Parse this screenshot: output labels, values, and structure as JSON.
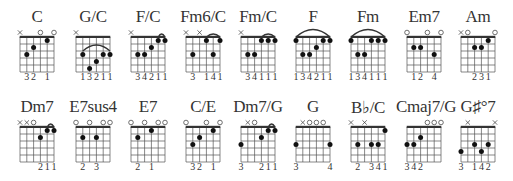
{
  "layout": {
    "columns_x": [
      37,
      93,
      148,
      203,
      258,
      313,
      368,
      424,
      478
    ],
    "rows_y": [
      0,
      90
    ]
  },
  "colors": {
    "ink": "#333333",
    "grid": "#555555"
  },
  "chords": [
    {
      "name": "C",
      "row": 0,
      "col": 0,
      "markers": [
        "x",
        "",
        "",
        "o",
        "",
        "o"
      ],
      "dots": [
        [
          1,
          3
        ],
        [
          2,
          2
        ],
        [
          4,
          1
        ]
      ],
      "barre": null,
      "arc": null,
      "fingering": [
        "",
        "3",
        "2",
        "",
        "1",
        ""
      ]
    },
    {
      "name": "G/C",
      "row": 0,
      "col": 1,
      "markers": [
        "x",
        "",
        "",
        "",
        "",
        ""
      ],
      "dots": [
        [
          1,
          3
        ],
        [
          2,
          5
        ],
        [
          3,
          4
        ],
        [
          4,
          3
        ],
        [
          5,
          3
        ]
      ],
      "barre": null,
      "arc": [
        1,
        5,
        3
      ],
      "fingering": [
        "",
        "1",
        "3",
        "2",
        "1",
        "1"
      ]
    },
    {
      "name": "F/C",
      "row": 0,
      "col": 2,
      "markers": [
        "x",
        "",
        "",
        "",
        "",
        ""
      ],
      "dots": [
        [
          1,
          3
        ],
        [
          2,
          3
        ],
        [
          3,
          2
        ],
        [
          4,
          1
        ],
        [
          5,
          1
        ]
      ],
      "barre": null,
      "arc": [
        4,
        5,
        1
      ],
      "fingering": [
        "",
        "3",
        "4",
        "2",
        "1",
        "1"
      ]
    },
    {
      "name": "Fm6/C",
      "row": 0,
      "col": 3,
      "markers": [
        "x",
        "",
        "x",
        "",
        "",
        ""
      ],
      "dots": [
        [
          1,
          3
        ],
        [
          3,
          1
        ],
        [
          4,
          3
        ],
        [
          5,
          1
        ]
      ],
      "barre": null,
      "arc": [
        3,
        5,
        1
      ],
      "fingering": [
        "",
        "3",
        "",
        "1",
        "4",
        "1"
      ]
    },
    {
      "name": "Fm/C",
      "row": 0,
      "col": 4,
      "markers": [
        "x",
        "",
        "",
        "",
        "",
        ""
      ],
      "dots": [
        [
          1,
          3
        ],
        [
          2,
          3
        ],
        [
          3,
          1
        ],
        [
          4,
          1
        ],
        [
          5,
          1
        ]
      ],
      "barre": null,
      "arc": [
        3,
        5,
        1
      ],
      "fingering": [
        "",
        "3",
        "4",
        "1",
        "1",
        "1"
      ]
    },
    {
      "name": "F",
      "row": 0,
      "col": 5,
      "markers": [
        "",
        "",
        "",
        "",
        "",
        ""
      ],
      "dots": [
        [
          0,
          1
        ],
        [
          1,
          3
        ],
        [
          2,
          3
        ],
        [
          3,
          2
        ],
        [
          4,
          1
        ],
        [
          5,
          1
        ]
      ],
      "barre": null,
      "arc": [
        0,
        5,
        1
      ],
      "fingering": [
        "1",
        "3",
        "4",
        "2",
        "1",
        "1"
      ]
    },
    {
      "name": "Fm",
      "row": 0,
      "col": 6,
      "markers": [
        "",
        "",
        "",
        "",
        "",
        ""
      ],
      "dots": [
        [
          0,
          1
        ],
        [
          1,
          3
        ],
        [
          2,
          3
        ],
        [
          3,
          1
        ],
        [
          4,
          1
        ],
        [
          5,
          1
        ]
      ],
      "barre": null,
      "arc": [
        0,
        5,
        1
      ],
      "fingering": [
        "1",
        "3",
        "4",
        "1",
        "1",
        "1"
      ]
    },
    {
      "name": "Em7",
      "row": 0,
      "col": 7,
      "markers": [
        "o",
        "",
        "",
        "o",
        "",
        "o"
      ],
      "dots": [
        [
          1,
          2
        ],
        [
          2,
          2
        ],
        [
          4,
          3
        ]
      ],
      "barre": null,
      "arc": null,
      "fingering": [
        "",
        "1",
        "2",
        "",
        "4",
        ""
      ]
    },
    {
      "name": "Am",
      "row": 0,
      "col": 8,
      "markers": [
        "x",
        "o",
        "",
        "",
        "",
        "o"
      ],
      "dots": [
        [
          2,
          2
        ],
        [
          3,
          2
        ],
        [
          4,
          1
        ]
      ],
      "barre": null,
      "arc": null,
      "fingering": [
        "",
        "",
        "2",
        "3",
        "1",
        ""
      ]
    },
    {
      "name": "Dm7",
      "row": 1,
      "col": 0,
      "markers": [
        "x",
        "x",
        "o",
        "",
        "",
        ""
      ],
      "dots": [
        [
          3,
          2
        ],
        [
          4,
          1
        ],
        [
          5,
          1
        ]
      ],
      "barre": null,
      "arc": [
        4,
        5,
        1
      ],
      "fingering": [
        "",
        "",
        "",
        "2",
        "1",
        "1"
      ]
    },
    {
      "name": "E7sus4",
      "row": 1,
      "col": 1,
      "markers": [
        "o",
        "",
        "o",
        "",
        "o",
        "o"
      ],
      "dots": [
        [
          1,
          2
        ],
        [
          3,
          2
        ]
      ],
      "barre": null,
      "arc": null,
      "fingering": [
        "",
        "2",
        "",
        "3",
        "",
        ""
      ]
    },
    {
      "name": "E7",
      "row": 1,
      "col": 2,
      "markers": [
        "o",
        "",
        "o",
        "",
        "o",
        "o"
      ],
      "dots": [
        [
          1,
          2
        ],
        [
          3,
          1
        ]
      ],
      "barre": null,
      "arc": null,
      "fingering": [
        "",
        "2",
        "",
        "1",
        "",
        ""
      ]
    },
    {
      "name": "C/E",
      "row": 1,
      "col": 3,
      "markers": [
        "o",
        "",
        "",
        "o",
        "",
        "o"
      ],
      "dots": [
        [
          1,
          3
        ],
        [
          2,
          2
        ],
        [
          4,
          1
        ]
      ],
      "barre": null,
      "arc": null,
      "fingering": [
        "",
        "3",
        "2",
        "",
        "1",
        ""
      ]
    },
    {
      "name": "Dm7/G",
      "row": 1,
      "col": 4,
      "markers": [
        "",
        "x",
        "o",
        "",
        "",
        ""
      ],
      "dots": [
        [
          0,
          3
        ],
        [
          3,
          2
        ],
        [
          4,
          1
        ],
        [
          5,
          1
        ]
      ],
      "barre": null,
      "arc": [
        4,
        5,
        1
      ],
      "fingering": [
        "3",
        "",
        "",
        "2",
        "1",
        "1"
      ]
    },
    {
      "name": "G",
      "row": 1,
      "col": 5,
      "markers": [
        "",
        "x",
        "o",
        "o",
        "o",
        ""
      ],
      "dots": [
        [
          0,
          3
        ],
        [
          5,
          3
        ]
      ],
      "barre": null,
      "arc": null,
      "fingering": [
        "3",
        "",
        "",
        "",
        "",
        "4"
      ]
    },
    {
      "name": "B♭/C",
      "row": 1,
      "col": 6,
      "markers": [
        "x",
        "",
        "x",
        "",
        "",
        ""
      ],
      "dots": [
        [
          1,
          3
        ],
        [
          3,
          3
        ],
        [
          4,
          3
        ],
        [
          5,
          1
        ]
      ],
      "barre": null,
      "arc": null,
      "fingering": [
        "",
        "2",
        "",
        "3",
        "4",
        "1"
      ]
    },
    {
      "name": "Cmaj7/G",
      "row": 1,
      "col": 7,
      "markers": [
        "",
        "",
        "",
        "o",
        "o",
        "o"
      ],
      "dots": [
        [
          0,
          3
        ],
        [
          1,
          3
        ],
        [
          2,
          2
        ]
      ],
      "barre": null,
      "arc": null,
      "fingering": [
        "3",
        "4",
        "2",
        "",
        "",
        ""
      ]
    },
    {
      "name": "G♯°7",
      "row": 1,
      "col": 8,
      "markers": [
        "",
        "x",
        "",
        "",
        "",
        "x"
      ],
      "dots": [
        [
          0,
          4
        ],
        [
          2,
          3
        ],
        [
          3,
          4
        ],
        [
          4,
          3
        ]
      ],
      "barre": null,
      "arc": null,
      "fingering": [
        "3",
        "",
        "1",
        "4",
        "2",
        ""
      ]
    }
  ]
}
